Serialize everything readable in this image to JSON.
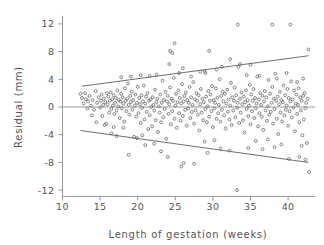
{
  "chart_data": {
    "type": "scatter",
    "title": "",
    "xlabel": "Length of gestation (weeks)",
    "ylabel": "Residual (mm)",
    "xlim": [
      10.0,
      43.6
    ],
    "ylim": [
      -13.2,
      13.2
    ],
    "xticks": [
      10,
      15,
      20,
      25,
      30,
      35,
      40
    ],
    "xtick_labels": [
      "10",
      "15",
      "20",
      "25",
      "30",
      "35",
      "40"
    ],
    "yticks": [
      12,
      8,
      4,
      0,
      -4,
      -8,
      -12
    ],
    "ytick_labels": [
      "12",
      "8",
      "4",
      "0",
      "-4",
      "-8",
      "-12"
    ],
    "grid": false,
    "legend": "none",
    "marker": "open-circle",
    "marker_size_px": 2.0,
    "marker_color": "#606060",
    "reference_lines": [
      {
        "name": "zero-residual-line",
        "kind": "horizontal",
        "y": 0,
        "color": "#9a9a9a",
        "x_from": 10.0,
        "x_to": 43.6
      },
      {
        "name": "upper-limit-line",
        "kind": "linear",
        "color": "#4a4a4a",
        "x_from": 12.6,
        "y_from": 3.0,
        "x_to": 42.7,
        "y_to": 7.4
      },
      {
        "name": "lower-limit-line",
        "kind": "linear",
        "color": "#4a4a4a",
        "x_from": 12.4,
        "y_from": -3.4,
        "x_to": 42.7,
        "y_to": -8.0
      }
    ],
    "points": [
      [
        12.4,
        1.9
      ],
      [
        12.6,
        1.3
      ],
      [
        12.8,
        0.5
      ],
      [
        13.0,
        2.0
      ],
      [
        13.1,
        1.1
      ],
      [
        13.3,
        -0.2
      ],
      [
        13.4,
        0.8
      ],
      [
        13.6,
        1.6
      ],
      [
        13.8,
        0.2
      ],
      [
        14.0,
        1.0
      ],
      [
        14.2,
        -0.4
      ],
      [
        14.4,
        2.3
      ],
      [
        14.6,
        0.6
      ],
      [
        14.8,
        1.4
      ],
      [
        15.0,
        -0.1
      ],
      [
        15.1,
        0.9
      ],
      [
        15.2,
        1.8
      ],
      [
        15.3,
        -1.3
      ],
      [
        15.4,
        0.3
      ],
      [
        15.5,
        1.2
      ],
      [
        15.6,
        -2.6
      ],
      [
        15.7,
        0.7
      ],
      [
        15.8,
        -2.4
      ],
      [
        15.9,
        2.0
      ],
      [
        16.0,
        0.4
      ],
      [
        16.1,
        1.5
      ],
      [
        16.2,
        -0.8
      ],
      [
        16.3,
        0.9
      ],
      [
        16.4,
        2.1
      ],
      [
        16.5,
        -0.3
      ],
      [
        16.6,
        1.1
      ],
      [
        16.7,
        0.2
      ],
      [
        16.8,
        1.7
      ],
      [
        16.9,
        -1.0
      ],
      [
        17.0,
        0.6
      ],
      [
        17.1,
        1.3
      ],
      [
        17.2,
        -0.5
      ],
      [
        17.3,
        2.4
      ],
      [
        17.4,
        0.1
      ],
      [
        17.5,
        1.0
      ],
      [
        17.6,
        -1.6
      ],
      [
        17.7,
        0.8
      ],
      [
        17.8,
        1.9
      ],
      [
        17.9,
        -0.2
      ],
      [
        18.0,
        1.4
      ],
      [
        18.1,
        0.5
      ],
      [
        18.2,
        -2.1
      ],
      [
        18.3,
        2.7
      ],
      [
        18.4,
        0.9
      ],
      [
        18.5,
        -0.6
      ],
      [
        18.6,
        1.2
      ],
      [
        18.7,
        3.4
      ],
      [
        18.8,
        0.3
      ],
      [
        18.9,
        -1.1
      ],
      [
        19.0,
        1.6
      ],
      [
        19.1,
        0.7
      ],
      [
        19.2,
        2.2
      ],
      [
        19.3,
        -0.4
      ],
      [
        19.4,
        1.0
      ],
      [
        19.5,
        -4.3
      ],
      [
        19.6,
        0.2
      ],
      [
        19.7,
        1.8
      ],
      [
        19.8,
        -1.4
      ],
      [
        19.9,
        0.6
      ],
      [
        20.0,
        2.9
      ],
      [
        20.1,
        -0.9
      ],
      [
        20.2,
        1.3
      ],
      [
        20.3,
        0.4
      ],
      [
        20.4,
        -2.3
      ],
      [
        20.5,
        1.7
      ],
      [
        20.6,
        -0.1
      ],
      [
        20.7,
        0.8
      ],
      [
        20.8,
        3.1
      ],
      [
        20.9,
        -1.8
      ],
      [
        21.0,
        0.5
      ],
      [
        21.1,
        1.5
      ],
      [
        21.2,
        -0.7
      ],
      [
        21.3,
        2.0
      ],
      [
        21.4,
        -3.2
      ],
      [
        21.5,
        0.9
      ],
      [
        21.6,
        -1.2
      ],
      [
        21.7,
        1.1
      ],
      [
        21.8,
        0.0
      ],
      [
        21.9,
        -2.8
      ],
      [
        22.0,
        1.4
      ],
      [
        22.1,
        0.3
      ],
      [
        22.2,
        -0.5
      ],
      [
        22.3,
        2.5
      ],
      [
        22.4,
        -1.9
      ],
      [
        22.5,
        0.7
      ],
      [
        22.6,
        1.2
      ],
      [
        22.7,
        -3.6
      ],
      [
        22.8,
        0.1
      ],
      [
        22.9,
        -0.8
      ],
      [
        23.0,
        1.8
      ],
      [
        23.1,
        -2.2
      ],
      [
        23.2,
        0.6
      ],
      [
        23.3,
        3.8
      ],
      [
        23.4,
        -1.5
      ],
      [
        23.5,
        1.0
      ],
      [
        23.6,
        -0.3
      ],
      [
        23.7,
        2.2
      ],
      [
        23.8,
        -4.6
      ],
      [
        23.9,
        0.8
      ],
      [
        24.0,
        1.6
      ],
      [
        24.1,
        -1.0
      ],
      [
        24.2,
        0.4
      ],
      [
        24.3,
        2.8
      ],
      [
        24.4,
        -2.5
      ],
      [
        24.5,
        1.2
      ],
      [
        24.6,
        -0.6
      ],
      [
        24.7,
        0.9
      ],
      [
        24.8,
        4.2
      ],
      [
        24.9,
        -1.7
      ],
      [
        25.0,
        0.2
      ],
      [
        25.1,
        1.9
      ],
      [
        25.2,
        -3.0
      ],
      [
        25.3,
        0.7
      ],
      [
        25.4,
        2.4
      ],
      [
        25.5,
        -0.9
      ],
      [
        25.6,
        1.3
      ],
      [
        25.7,
        -2.0
      ],
      [
        25.8,
        0.5
      ],
      [
        25.9,
        3.3
      ],
      [
        26.0,
        -1.3
      ],
      [
        26.1,
        0.8
      ],
      [
        26.2,
        1.6
      ],
      [
        26.3,
        -0.4
      ],
      [
        26.4,
        2.1
      ],
      [
        26.5,
        -2.7
      ],
      [
        26.6,
        1.0
      ],
      [
        26.7,
        -0.2
      ],
      [
        26.8,
        0.6
      ],
      [
        26.9,
        2.9
      ],
      [
        27.0,
        -1.6
      ],
      [
        27.1,
        1.4
      ],
      [
        27.2,
        -0.7
      ],
      [
        27.3,
        0.3
      ],
      [
        27.4,
        3.6
      ],
      [
        27.5,
        -2.4
      ],
      [
        27.6,
        1.1
      ],
      [
        27.7,
        -0.5
      ],
      [
        27.8,
        2.0
      ],
      [
        27.9,
        0.9
      ],
      [
        28.0,
        -1.1
      ],
      [
        28.1,
        1.7
      ],
      [
        28.2,
        -3.4
      ],
      [
        28.3,
        0.4
      ],
      [
        28.4,
        2.6
      ],
      [
        28.5,
        -0.8
      ],
      [
        28.6,
        1.2
      ],
      [
        28.7,
        -1.9
      ],
      [
        28.8,
        0.7
      ],
      [
        28.9,
        5.2
      ],
      [
        29.0,
        -0.3
      ],
      [
        29.1,
        1.5
      ],
      [
        29.2,
        -2.2
      ],
      [
        29.3,
        0.1
      ],
      [
        29.4,
        2.3
      ],
      [
        29.5,
        -1.4
      ],
      [
        29.6,
        0.9
      ],
      [
        29.7,
        1.8
      ],
      [
        29.8,
        -0.6
      ],
      [
        29.9,
        3.0
      ],
      [
        30.0,
        -2.9
      ],
      [
        30.1,
        1.0
      ],
      [
        30.2,
        -0.2
      ],
      [
        30.3,
        0.6
      ],
      [
        30.4,
        2.7
      ],
      [
        30.5,
        -1.7
      ],
      [
        30.6,
        1.3
      ],
      [
        30.7,
        -0.9
      ],
      [
        30.8,
        0.3
      ],
      [
        30.9,
        4.0
      ],
      [
        31.0,
        -2.1
      ],
      [
        31.1,
        1.6
      ],
      [
        31.2,
        -0.4
      ],
      [
        31.3,
        2.2
      ],
      [
        31.4,
        0.8
      ],
      [
        31.5,
        -1.2
      ],
      [
        31.6,
        1.9
      ],
      [
        31.7,
        -3.1
      ],
      [
        31.8,
        0.5
      ],
      [
        31.9,
        2.5
      ],
      [
        32.0,
        -0.7
      ],
      [
        32.1,
        1.1
      ],
      [
        32.2,
        -1.8
      ],
      [
        32.3,
        0.2
      ],
      [
        32.4,
        3.5
      ],
      [
        32.5,
        -2.6
      ],
      [
        32.6,
        1.4
      ],
      [
        32.7,
        -0.5
      ],
      [
        32.8,
        0.9
      ],
      [
        32.9,
        2.8
      ],
      [
        33.0,
        -1.5
      ],
      [
        33.1,
        1.7
      ],
      [
        33.2,
        -0.1
      ],
      [
        33.3,
        0.6
      ],
      [
        33.4,
        5.8
      ],
      [
        33.5,
        -2.3
      ],
      [
        33.6,
        1.2
      ],
      [
        33.7,
        -0.8
      ],
      [
        33.8,
        2.1
      ],
      [
        33.9,
        0.4
      ],
      [
        34.0,
        -1.9
      ],
      [
        34.1,
        1.5
      ],
      [
        34.2,
        -3.7
      ],
      [
        34.3,
        0.7
      ],
      [
        34.4,
        2.4
      ],
      [
        34.5,
        -0.3
      ],
      [
        34.6,
        1.0
      ],
      [
        34.7,
        -1.3
      ],
      [
        34.8,
        0.2
      ],
      [
        34.9,
        3.2
      ],
      [
        35.0,
        -2.5
      ],
      [
        35.1,
        1.8
      ],
      [
        35.2,
        -0.6
      ],
      [
        35.3,
        0.9
      ],
      [
        35.4,
        2.6
      ],
      [
        35.5,
        -1.6
      ],
      [
        35.6,
        1.3
      ],
      [
        35.7,
        -0.2
      ],
      [
        35.8,
        0.5
      ],
      [
        35.9,
        4.4
      ],
      [
        36.0,
        -2.8
      ],
      [
        36.1,
        1.1
      ],
      [
        36.2,
        -0.9
      ],
      [
        36.3,
        2.0
      ],
      [
        36.4,
        0.3
      ],
      [
        36.5,
        -1.4
      ],
      [
        36.6,
        1.6
      ],
      [
        36.7,
        -3.3
      ],
      [
        36.8,
        0.8
      ],
      [
        36.9,
        2.3
      ],
      [
        37.0,
        -0.5
      ],
      [
        37.1,
        1.4
      ],
      [
        37.2,
        -2.0
      ],
      [
        37.3,
        0.1
      ],
      [
        37.4,
        3.9
      ],
      [
        37.5,
        -1.1
      ],
      [
        37.6,
        1.9
      ],
      [
        37.7,
        -0.7
      ],
      [
        37.8,
        0.6
      ],
      [
        37.9,
        2.9
      ],
      [
        38.0,
        -2.4
      ],
      [
        38.1,
        1.2
      ],
      [
        38.2,
        -0.3
      ],
      [
        38.3,
        4.8
      ],
      [
        38.4,
        0.9
      ],
      [
        38.5,
        -1.7
      ],
      [
        38.6,
        1.5
      ],
      [
        38.7,
        -3.9
      ],
      [
        38.8,
        0.4
      ],
      [
        38.9,
        2.2
      ],
      [
        39.0,
        -0.8
      ],
      [
        39.1,
        1.0
      ],
      [
        39.2,
        -2.1
      ],
      [
        39.3,
        0.7
      ],
      [
        39.4,
        3.1
      ],
      [
        39.5,
        -1.2
      ],
      [
        39.6,
        1.7
      ],
      [
        39.7,
        -0.4
      ],
      [
        39.8,
        0.2
      ],
      [
        39.9,
        2.6
      ],
      [
        40.0,
        -2.7
      ],
      [
        40.1,
        1.3
      ],
      [
        40.2,
        -0.6
      ],
      [
        40.3,
        0.8
      ],
      [
        40.4,
        3.7
      ],
      [
        40.5,
        -1.5
      ],
      [
        40.6,
        1.1
      ],
      [
        40.7,
        -0.1
      ],
      [
        40.8,
        2.4
      ],
      [
        40.9,
        -3.5
      ],
      [
        41.0,
        0.5
      ],
      [
        41.1,
        1.8
      ],
      [
        41.2,
        -1.0
      ],
      [
        41.3,
        0.3
      ],
      [
        41.4,
        2.7
      ],
      [
        41.5,
        -2.2
      ],
      [
        41.6,
        1.4
      ],
      [
        41.7,
        -0.5
      ],
      [
        41.8,
        0.9
      ],
      [
        41.9,
        -4.1
      ],
      [
        42.0,
        1.6
      ],
      [
        42.1,
        -1.8
      ],
      [
        42.2,
        2.0
      ],
      [
        42.3,
        -0.2
      ],
      [
        42.4,
        0.6
      ],
      [
        42.5,
        -5.2
      ],
      [
        42.6,
        1.2
      ],
      [
        42.7,
        8.3
      ],
      [
        42.8,
        -9.4
      ],
      [
        24.9,
        9.2
      ],
      [
        24.3,
        8.1
      ],
      [
        24.6,
        7.8
      ],
      [
        29.5,
        8.1
      ],
      [
        33.3,
        11.9
      ],
      [
        37.9,
        11.9
      ],
      [
        40.3,
        11.9
      ],
      [
        32.3,
        6.9
      ],
      [
        33.6,
        6.2
      ],
      [
        35.0,
        6.1
      ],
      [
        30.5,
        5.4
      ],
      [
        31.2,
        5.8
      ],
      [
        28.3,
        5.1
      ],
      [
        26.0,
        5.6
      ],
      [
        22.5,
        4.7
      ],
      [
        20.4,
        4.6
      ],
      [
        21.6,
        4.5
      ],
      [
        19.1,
        4.4
      ],
      [
        17.8,
        4.3
      ],
      [
        24.2,
        6.2
      ],
      [
        25.5,
        4.9
      ],
      [
        27.1,
        4.4
      ],
      [
        29.0,
        4.9
      ],
      [
        34.5,
        4.6
      ],
      [
        36.2,
        4.5
      ],
      [
        38.5,
        4.1
      ],
      [
        39.8,
        4.9
      ],
      [
        41.2,
        3.6
      ],
      [
        42.0,
        4.1
      ],
      [
        33.2,
        -12.0
      ],
      [
        25.8,
        -8.6
      ],
      [
        26.1,
        -8.1
      ],
      [
        27.5,
        -8.2
      ],
      [
        24.0,
        -7.2
      ],
      [
        18.8,
        -6.9
      ],
      [
        23.1,
        -6.4
      ],
      [
        29.3,
        -6.6
      ],
      [
        31.0,
        -6.0
      ],
      [
        32.2,
        -6.3
      ],
      [
        34.7,
        -5.9
      ],
      [
        36.6,
        -6.1
      ],
      [
        38.2,
        -5.8
      ],
      [
        40.1,
        -7.5
      ],
      [
        41.5,
        -7.2
      ],
      [
        42.3,
        -7.6
      ],
      [
        21.0,
        -5.5
      ],
      [
        22.2,
        -5.3
      ],
      [
        28.9,
        -5.0
      ],
      [
        30.2,
        -4.8
      ],
      [
        16.5,
        -3.8
      ],
      [
        17.2,
        -4.2
      ],
      [
        19.9,
        -4.5
      ],
      [
        20.6,
        -4.1
      ],
      [
        35.7,
        -4.9
      ],
      [
        37.3,
        -4.7
      ],
      [
        39.1,
        -5.4
      ],
      [
        41.8,
        -5.6
      ],
      [
        13.9,
        -1.2
      ],
      [
        14.5,
        -2.2
      ],
      [
        16.8,
        -2.9
      ],
      [
        18.1,
        -3.0
      ]
    ]
  }
}
